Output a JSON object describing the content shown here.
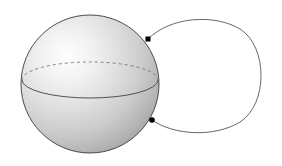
{
  "figure": {
    "background_color": "#ffffff",
    "canvas": {
      "width": 282,
      "height": 166
    },
    "sphere": {
      "label": "shaded sphere",
      "center_x": 90,
      "center_y": 84,
      "radius": 69,
      "outline_color": "#3a3a3a",
      "outline_width": 0.9,
      "highlight_color": "#fdfdfd",
      "midtone_color": "#d2d2d2",
      "shadow_color": "#9b9b9b",
      "highlight_x": 62,
      "highlight_y": 68
    },
    "equator": {
      "label": "equator ellipse",
      "center_x": 90,
      "center_y": 80,
      "rx": 68,
      "ry": 18,
      "front_style": "solid",
      "back_style": "dashed",
      "stroke_color": "#4a4a4a",
      "dash_pattern": "3 3"
    },
    "loop": {
      "label": "attached loop curve",
      "stroke_color": "#555555",
      "stroke_width": 0.9,
      "fill": "none",
      "right_extent_x": 263,
      "top_y": 20,
      "bottom_y": 131
    },
    "markers": [
      {
        "label": "upper attachment point",
        "x": 148,
        "y": 39,
        "size": 5,
        "color": "#000000",
        "shape": "square"
      },
      {
        "label": "lower attachment point",
        "x": 152,
        "y": 120,
        "size": 5,
        "color": "#000000",
        "shape": "circle"
      }
    ]
  }
}
